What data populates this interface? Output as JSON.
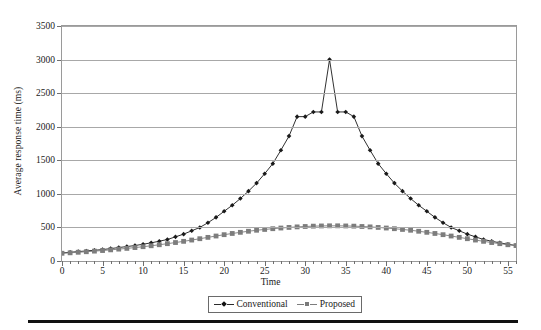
{
  "chart_data": {
    "type": "line",
    "title": "",
    "xlabel": "Time",
    "ylabel": "Average response time (ms)",
    "xlim": [
      0,
      56
    ],
    "ylim": [
      0,
      3500
    ],
    "xticks": [
      0,
      5,
      10,
      15,
      20,
      25,
      30,
      35,
      40,
      45,
      50,
      55
    ],
    "yticks": [
      0,
      500,
      1000,
      1500,
      2000,
      2500,
      3000,
      3500
    ],
    "grid": "horizontal",
    "legend_position": "bottom-center",
    "x": [
      0,
      1,
      2,
      3,
      4,
      5,
      6,
      7,
      8,
      9,
      10,
      11,
      12,
      13,
      14,
      15,
      16,
      17,
      18,
      19,
      20,
      21,
      22,
      23,
      24,
      25,
      26,
      27,
      28,
      29,
      30,
      31,
      32,
      33,
      34,
      35,
      36,
      37,
      38,
      39,
      40,
      41,
      42,
      43,
      44,
      45,
      46,
      47,
      48,
      49,
      50,
      51,
      52,
      53,
      54,
      55,
      56
    ],
    "series": [
      {
        "name": "Conventional",
        "color": "#1a1a1a",
        "marker": "diamond",
        "values": [
          120,
          130,
          140,
          150,
          160,
          170,
          185,
          200,
          215,
          230,
          250,
          270,
          295,
          320,
          360,
          400,
          450,
          500,
          570,
          650,
          740,
          830,
          930,
          1040,
          1160,
          1300,
          1450,
          1650,
          1860,
          2150,
          2150,
          2220,
          2220,
          3000,
          2220,
          2220,
          2150,
          1860,
          1650,
          1450,
          1300,
          1160,
          1040,
          930,
          830,
          740,
          650,
          570,
          500,
          450,
          400,
          360,
          320,
          295,
          270,
          250,
          230
        ]
      },
      {
        "name": "Proposed",
        "color": "#7d7d7d",
        "marker": "square",
        "values": [
          115,
          122,
          130,
          138,
          147,
          156,
          166,
          177,
          188,
          200,
          213,
          227,
          242,
          258,
          275,
          293,
          312,
          332,
          352,
          372,
          392,
          410,
          427,
          443,
          458,
          470,
          481,
          491,
          500,
          508,
          514,
          519,
          522,
          524,
          524,
          522,
          519,
          514,
          508,
          500,
          491,
          481,
          470,
          458,
          443,
          427,
          410,
          392,
          372,
          352,
          332,
          312,
          293,
          275,
          258,
          242,
          230
        ]
      }
    ]
  },
  "legend": {
    "items": [
      {
        "label": "Conventional",
        "marker": "diamond"
      },
      {
        "label": "Proposed",
        "marker": "square"
      }
    ]
  }
}
